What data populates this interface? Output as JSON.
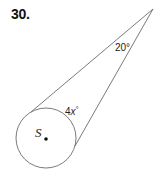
{
  "problem": {
    "number": "30."
  },
  "figure": {
    "circle_label": "S",
    "apex_angle_label": "20°",
    "arc_label_coef": "4",
    "arc_label_var": "x",
    "arc_label_unit": "°",
    "colors": {
      "stroke": "#6b6b6b",
      "text": "#222222",
      "center_dot": "#111111"
    }
  }
}
